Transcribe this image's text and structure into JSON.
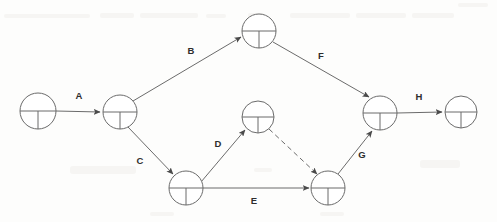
{
  "diagram": {
    "type": "network-diagram",
    "colors": {
      "stroke": "#6b6b6b",
      "label": "#2d2d2d",
      "background": "#fdfdfc"
    },
    "nodes": [
      {
        "id": "n1",
        "cx": 38,
        "cy": 111,
        "r": 18,
        "name": "node-start"
      },
      {
        "id": "n2",
        "cx": 120,
        "cy": 112,
        "r": 17,
        "name": "node-2"
      },
      {
        "id": "n3",
        "cx": 259,
        "cy": 31,
        "r": 17,
        "name": "node-top"
      },
      {
        "id": "n4",
        "cx": 258,
        "cy": 117,
        "r": 16,
        "name": "node-middle"
      },
      {
        "id": "n5",
        "cx": 186,
        "cy": 188,
        "r": 17,
        "name": "node-bottom-left"
      },
      {
        "id": "n6",
        "cx": 328,
        "cy": 188,
        "r": 17,
        "name": "node-bottom-right"
      },
      {
        "id": "n7",
        "cx": 380,
        "cy": 113,
        "r": 17,
        "name": "node-merge"
      },
      {
        "id": "n8",
        "cx": 461,
        "cy": 112,
        "r": 16,
        "name": "node-end"
      }
    ],
    "edges": [
      {
        "id": "e-a",
        "label": "A",
        "from": "n1",
        "to": "n2",
        "style": "solid",
        "label_x": 79,
        "label_y": 96
      },
      {
        "id": "e-b",
        "label": "B",
        "from": "n2",
        "to": "n3",
        "style": "solid",
        "label_x": 191,
        "label_y": 51
      },
      {
        "id": "e-c",
        "label": "C",
        "from": "n2",
        "to": "n5",
        "style": "solid",
        "label_x": 140,
        "label_y": 161
      },
      {
        "id": "e-d",
        "label": "D",
        "from": "n5",
        "to": "n4",
        "style": "solid",
        "label_x": 218,
        "label_y": 144
      },
      {
        "id": "e-e",
        "label": "E",
        "from": "n5",
        "to": "n6",
        "style": "solid",
        "label_x": 254,
        "label_y": 201
      },
      {
        "id": "e-f",
        "label": "F",
        "from": "n3",
        "to": "n7",
        "style": "solid",
        "label_x": 321,
        "label_y": 56
      },
      {
        "id": "e-g",
        "label": "G",
        "from": "n6",
        "to": "n7",
        "style": "solid",
        "label_x": 362,
        "label_y": 155
      },
      {
        "id": "e-h",
        "label": "H",
        "from": "n7",
        "to": "n8",
        "style": "solid",
        "label_x": 419,
        "label_y": 97
      },
      {
        "id": "e-dummy",
        "label": "",
        "from": "n4",
        "to": "n6",
        "style": "dashed",
        "label_x": 0,
        "label_y": 0
      }
    ],
    "edge_labels": {
      "a": "A",
      "b": "B",
      "c": "C",
      "d": "D",
      "e": "E",
      "f": "F",
      "g": "G",
      "h": "H"
    }
  }
}
